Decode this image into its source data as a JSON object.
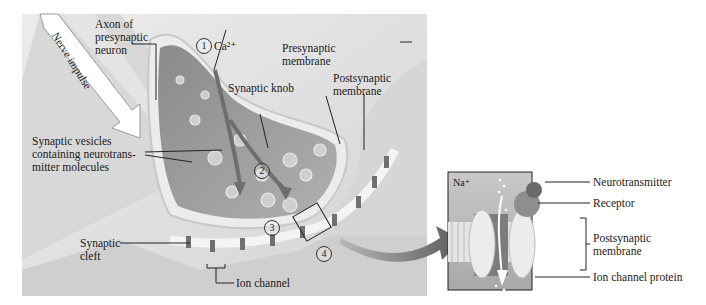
{
  "figure": {
    "main_panel": {
      "labels": {
        "nerve_impulse": "Nerve impulse",
        "axon": "Axon of\npresynaptic\nneuron",
        "calcium": "Ca²⁺",
        "synaptic_knob": "Synaptic knob",
        "presynaptic_membrane": "Presynaptic\nmembrane",
        "postsynaptic_membrane": "Postsynaptic\nmembrane",
        "synaptic_vesicles": "Synaptic vesicles\ncontaining neurotrans-\nmitter molecules",
        "synaptic_cleft": "Synaptic\ncleft",
        "ion_channel": "Ion channel"
      },
      "step_numbers": [
        "1",
        "2",
        "3",
        "4"
      ]
    },
    "inset_panel": {
      "labels": {
        "sodium": "Na⁺",
        "neurotransmitter": "Neurotransmitter",
        "receptor": "Receptor",
        "postsynaptic_membrane": "Postsynaptic\nmembrane",
        "ion_channel_protein": "Ion channel protein"
      }
    },
    "colors": {
      "background": "#e6e6e6",
      "axon": "#d2d2d2",
      "knob_interior": "#9a9a9a",
      "membrane": "#ececec",
      "arrow": "#6a6a6a",
      "text": "#1a1a1a"
    }
  }
}
